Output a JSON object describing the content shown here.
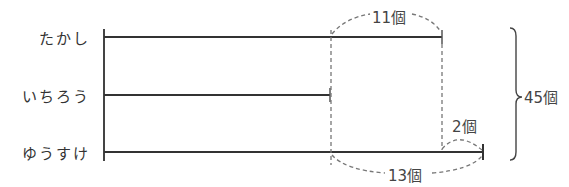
{
  "diagram": {
    "type": "tape-diagram",
    "rows": [
      {
        "name": "たかし",
        "relation": "いちろう + 11個"
      },
      {
        "name": "いちろう",
        "relation": "base"
      },
      {
        "name": "ゆうすけ",
        "relation": "いちろう + 13個 (たかし + 2個)"
      }
    ],
    "annotations": {
      "top_diff": "11個",
      "right_small_diff": "2個",
      "bottom_diff": "13個",
      "total": "45個"
    },
    "colors": {
      "line": "#333333",
      "dashed": "#777777",
      "text": "#333333"
    }
  }
}
